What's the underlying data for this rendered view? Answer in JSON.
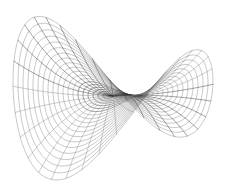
{
  "figure": {
    "name": "saddle-surface-wireframe",
    "title": "",
    "subtitle": "",
    "caption": "",
    "background_color": "#ffffff",
    "width": 226,
    "height": 191,
    "has_axes": false,
    "has_axis_labels": false,
    "has_tick_labels": false,
    "has_legend": false,
    "has_border": false,
    "has_text": false
  },
  "chart_data": {
    "type": "line",
    "render_style": "3d-wireframe-mesh",
    "title": "",
    "subtitle": "",
    "xlabel": "",
    "ylabel": "",
    "zlabel": "",
    "grid": false,
    "legend_position": "none",
    "surface": {
      "description": "Hyperbolic paraboloid (saddle) surface drawn as a polar wireframe mesh",
      "equation": "z = r^2 * cos(2*theta)",
      "coordinate_system": "polar",
      "r_range": [
        0,
        1
      ],
      "theta_range_deg": [
        0,
        360
      ],
      "z_range": [
        -1,
        1
      ],
      "ring_count": 20,
      "spoke_count": 36,
      "ring_r_values": [
        0.05,
        0.1,
        0.15,
        0.2,
        0.25,
        0.3,
        0.35,
        0.4,
        0.45,
        0.5,
        0.55,
        0.6,
        0.65,
        0.7,
        0.75,
        0.8,
        0.85,
        0.9,
        0.95,
        1.0
      ],
      "spoke_theta_deg": [
        0,
        10,
        20,
        30,
        40,
        50,
        60,
        70,
        80,
        90,
        100,
        110,
        120,
        130,
        140,
        150,
        160,
        170,
        180,
        190,
        200,
        210,
        220,
        230,
        240,
        250,
        260,
        270,
        280,
        290,
        300,
        310,
        320,
        330,
        340,
        350
      ]
    },
    "projection": {
      "type": "orthographic",
      "elevation_deg": 28,
      "azimuth_deg": 38,
      "center_px": [
        113,
        96
      ],
      "scale_x_px": 100,
      "scale_y_px": 58,
      "scale_z_px": 62
    },
    "style": {
      "line_color": "#767676",
      "line_color_dark": "#2a2a2a",
      "line_width": 0.55,
      "background_color": "#ffffff"
    },
    "extents_px": {
      "left": 12,
      "right": 215,
      "top": 12,
      "bottom": 178,
      "saddle_center": [
        118,
        98
      ],
      "left_peak": [
        52,
        14
      ],
      "right_peak": [
        188,
        40
      ],
      "front_valley": [
        88,
        176
      ]
    }
  }
}
